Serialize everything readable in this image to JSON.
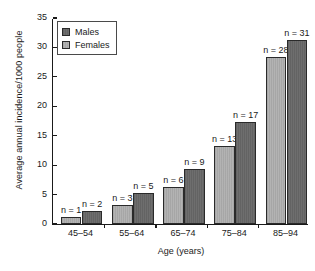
{
  "chart_data": {
    "type": "bar",
    "title": "",
    "xlabel": "Age (years)",
    "ylabel": "Average annual incidence/1000 people",
    "categories": [
      "45–54",
      "55–64",
      "65–74",
      "75–84",
      "85–94"
    ],
    "ylim": [
      0,
      35
    ],
    "yticks": [
      0,
      5,
      10,
      15,
      20,
      25,
      30,
      35
    ],
    "ytick_labels": [
      "0",
      "5",
      "10",
      "15",
      "20",
      "25",
      "30",
      "35"
    ],
    "grid": false,
    "legend_position": "upper left",
    "series": [
      {
        "name": "Females",
        "color": "#b3b3b3",
        "values": [
          1.2,
          3.2,
          6.3,
          13.2,
          28.3
        ],
        "point_labels": [
          "n = 1",
          "n = 3",
          "n = 6",
          "n = 13",
          "n = 28"
        ]
      },
      {
        "name": "Males",
        "color": "#6e6e6e",
        "values": [
          2.2,
          5.3,
          9.3,
          17.3,
          31.2
        ],
        "point_labels": [
          "n = 2",
          "n = 5",
          "n = 9",
          "n = 17",
          "n = 31"
        ]
      }
    ]
  },
  "legend": {
    "entries": [
      {
        "label": "Males",
        "swatch": "dark"
      },
      {
        "label": "Females",
        "swatch": "light"
      }
    ]
  }
}
